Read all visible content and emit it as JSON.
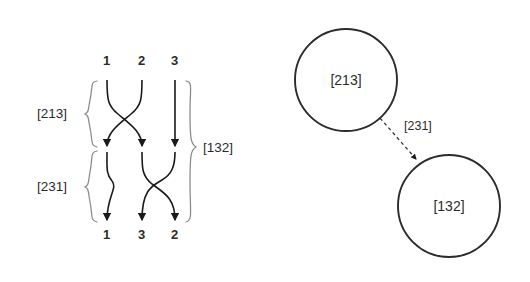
{
  "figure": {
    "background_color": "#ffffff",
    "stroke_color": "#1a1a1a",
    "brace_color": "#7a7a7a",
    "text_color": "#2b2b2b"
  },
  "braid": {
    "top_labels": [
      "1",
      "2",
      "3"
    ],
    "bottom_labels": [
      "1",
      "3",
      "2"
    ],
    "left_brace_labels": [
      "[213]",
      "[231]"
    ],
    "right_brace_label": "[132]",
    "columns_x": [
      107,
      142,
      175
    ],
    "rows_y": [
      80,
      148,
      222
    ]
  },
  "graph": {
    "nodes": [
      {
        "label": "[213]",
        "cx": 346,
        "cy": 80,
        "r": 51
      },
      {
        "label": "[132]",
        "cx": 449,
        "cy": 206,
        "r": 51
      }
    ],
    "edge": {
      "label": "[231]",
      "style": "dashed",
      "from": "[213]",
      "to": "[132]"
    }
  }
}
